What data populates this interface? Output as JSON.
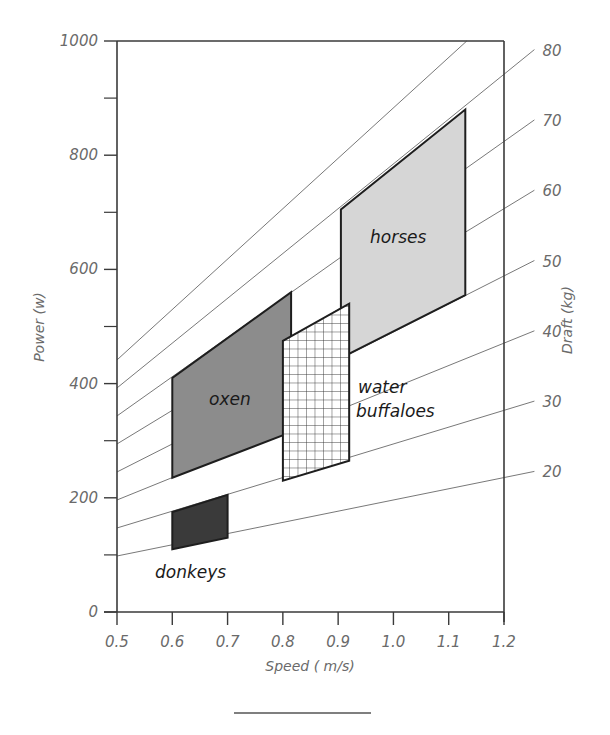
{
  "chart_data": {
    "type": "area",
    "title": "",
    "xlabel": "Speed ( m/s)",
    "ylabel": "Power (w)",
    "y2label": "Draft (kg)",
    "xlim": [
      0.5,
      1.2
    ],
    "ylim": [
      0,
      1000
    ],
    "x_ticks": [
      "0.5",
      "0.6",
      "0.7",
      "0.8",
      "0.9",
      "1.0",
      "1.1",
      "1.2"
    ],
    "y_ticks": [
      "0",
      "200",
      "400",
      "600",
      "800",
      "1000"
    ],
    "y_minor_ticks": [
      100,
      300,
      500,
      700,
      900
    ],
    "draft_lines": {
      "description": "Lines of constant draft force: Power = draft(kg) x 9.81 x speed",
      "labels": [
        "20",
        "30",
        "40",
        "50",
        "60",
        "70",
        "80"
      ],
      "values_kg": [
        20,
        30,
        40,
        50,
        60,
        70,
        80,
        90
      ]
    },
    "grid": false,
    "legend": null,
    "series": [
      {
        "name": "donkeys",
        "fill": "#3a3a3a",
        "pattern": "solid-dark",
        "polygon": [
          [
            0.6,
            110
          ],
          [
            0.6,
            175
          ],
          [
            0.7,
            205
          ],
          [
            0.7,
            130
          ]
        ],
        "speed_range": [
          0.6,
          0.7
        ],
        "power_range": [
          110,
          205
        ]
      },
      {
        "name": "oxen",
        "fill": "#8c8c8c",
        "pattern": "solid-medium",
        "polygon": [
          [
            0.6,
            235
          ],
          [
            0.6,
            410
          ],
          [
            0.815,
            560
          ],
          [
            0.815,
            315
          ]
        ],
        "speed_range": [
          0.6,
          0.815
        ],
        "power_range": [
          235,
          560
        ]
      },
      {
        "name": "water buffaloes",
        "fill": "#ffffff",
        "pattern": "grid-hatch",
        "polygon": [
          [
            0.8,
            230
          ],
          [
            0.8,
            475
          ],
          [
            0.92,
            540
          ],
          [
            0.92,
            265
          ]
        ],
        "speed_range": [
          0.8,
          0.92
        ],
        "power_range": [
          230,
          540
        ]
      },
      {
        "name": "horses",
        "fill": "#d6d6d6",
        "pattern": "solid-light",
        "polygon": [
          [
            0.905,
            445
          ],
          [
            0.905,
            705
          ],
          [
            1.13,
            880
          ],
          [
            1.13,
            555
          ]
        ],
        "speed_range": [
          0.905,
          1.13
        ],
        "power_range": [
          445,
          880
        ]
      }
    ],
    "annotations": [
      "donkeys",
      "oxen",
      "water",
      "buffaloes",
      "horses"
    ]
  },
  "labels": {
    "xlabel": "Speed ( m/s)",
    "ylabel": "Power (w)",
    "y2label": "Draft (kg)",
    "x_ticks": [
      "0.5",
      "0.6",
      "0.7",
      "0.8",
      "0.9",
      "1.0",
      "1.1",
      "1.2"
    ],
    "y_ticks": [
      "0",
      "200",
      "400",
      "600",
      "800",
      "1000"
    ],
    "draft_ticks": [
      "20",
      "30",
      "40",
      "50",
      "60",
      "70",
      "80"
    ],
    "donkeys": "donkeys",
    "oxen": "oxen",
    "water": "water",
    "buffaloes": "buffaloes",
    "horses": "horses"
  }
}
